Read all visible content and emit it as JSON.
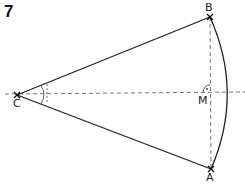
{
  "exercise_number": "7",
  "points": {
    "C": {
      "label": "C",
      "x": 17,
      "y": 95
    },
    "B": {
      "label": "B",
      "x": 210,
      "y": 17
    },
    "A": {
      "label": "A",
      "x": 211,
      "y": 169
    },
    "M": {
      "label": "M",
      "x": 210,
      "y": 92
    }
  },
  "lines": [
    {
      "name": "segment-CB",
      "style": "solid"
    },
    {
      "name": "segment-CA",
      "style": "solid"
    },
    {
      "name": "arc-BA",
      "style": "solid"
    },
    {
      "name": "axis-horizontal",
      "style": "dashed"
    },
    {
      "name": "segment-BA",
      "style": "dashed"
    }
  ],
  "marks": {
    "angle_at_C": "two arcs (bisected angle)",
    "angle_at_M": "right angle"
  },
  "colors": {
    "stroke": "#222222",
    "dash": "#777777",
    "background": "#ffffff"
  }
}
